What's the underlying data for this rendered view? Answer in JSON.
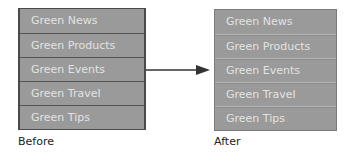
{
  "before": {
    "caption": "Before",
    "items": [
      "Green News",
      "Green Products",
      "Green Events",
      "Green Travel",
      "Green Tips"
    ]
  },
  "after": {
    "caption": "After",
    "items": [
      "Green News",
      "Green Products",
      "Green Events",
      "Green Travel",
      "Green Tips"
    ]
  },
  "colors": {
    "menu_bg": "#9a9a9a",
    "menu_text": "#e2e2e2",
    "before_separator": "#555555",
    "after_separator_light": "#b4b4b4",
    "arrow": "#333333"
  }
}
